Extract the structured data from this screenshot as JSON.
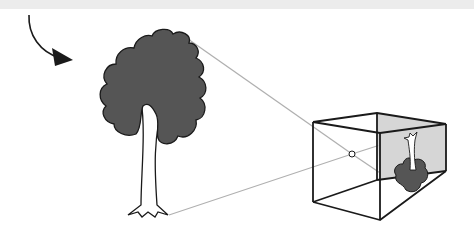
{
  "diagram": {
    "labels": [],
    "colors": {
      "background": "#ffffff",
      "top_band": "#ececec",
      "foliage": "#555555",
      "outline": "#1a1a1a",
      "light_ray": "#b0b0b0",
      "back_wall": "#d6d6d6"
    },
    "elements": {
      "arrow": "curved-arrow pointing at tree",
      "object": "tree",
      "camera": "box with pinhole",
      "image": "inverted tree on back wall"
    }
  }
}
